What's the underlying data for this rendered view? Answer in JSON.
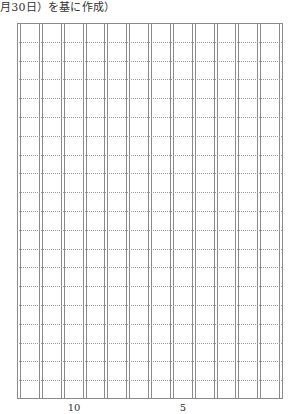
{
  "caption": "月30日）を基に作成）",
  "manuscript_grid": {
    "columns": 12,
    "rows_per_column": 20,
    "line_style": "double-solid vertical, dotted horizontal",
    "line_color": "#8a8a8a"
  },
  "column_markers": [
    {
      "label": "10",
      "column_from_right": 10
    },
    {
      "label": "5",
      "column_from_right": 5
    }
  ]
}
